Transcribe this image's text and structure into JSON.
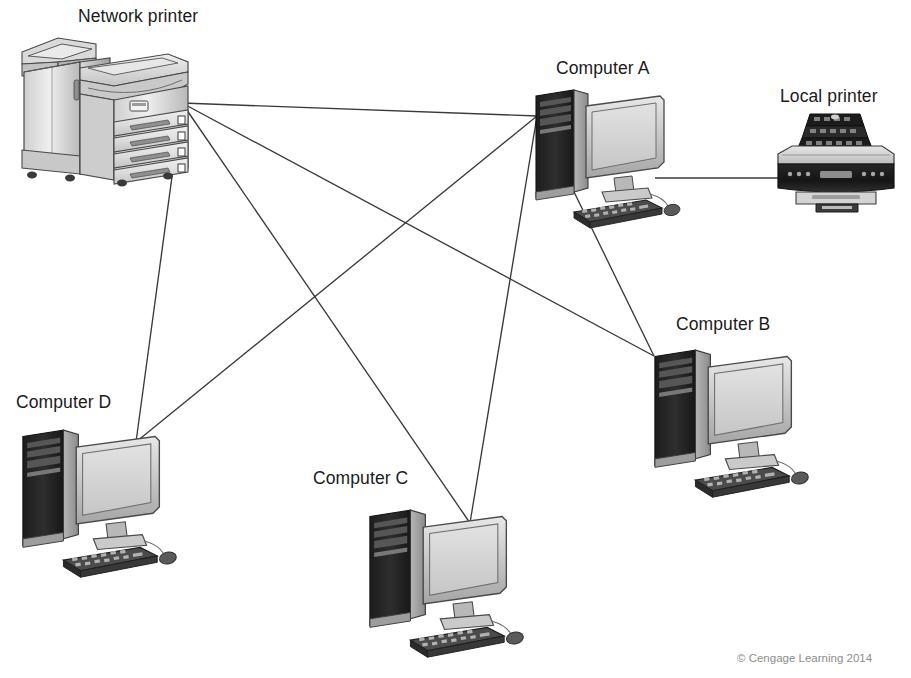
{
  "diagram": {
    "background_color": "#ffffff",
    "line_color": "#3a3a3a",
    "label_color": "#1b1b1b",
    "copyright": "© Cengage Learning 2014",
    "nodes": [
      {
        "id": "network-printer",
        "label": "Network printer",
        "type": "network-printer",
        "label_x": 78,
        "label_y": 6,
        "x": 18,
        "y": 28,
        "w": 175,
        "h": 160,
        "port_x": 182,
        "port_y": 103
      },
      {
        "id": "computer-a",
        "label": "Computer A",
        "type": "desktop-computer",
        "label_x": 556,
        "label_y": 58,
        "x": 528,
        "y": 88,
        "w": 150,
        "h": 150,
        "port_x": 537,
        "port_y": 116,
        "monitor_port_x": 655,
        "monitor_port_y": 178
      },
      {
        "id": "local-printer",
        "label": "Local printer",
        "type": "inkjet-printer",
        "label_x": 780,
        "label_y": 86,
        "x": 772,
        "y": 108,
        "w": 125,
        "h": 105,
        "port_x": 781,
        "port_y": 178
      },
      {
        "id": "computer-b",
        "label": "Computer B",
        "type": "desktop-computer",
        "label_x": 676,
        "label_y": 314,
        "x": 640,
        "y": 348,
        "w": 175,
        "h": 160,
        "port_x": 654,
        "port_y": 356
      },
      {
        "id": "computer-c",
        "label": "Computer C",
        "type": "desktop-computer",
        "label_x": 313,
        "label_y": 468,
        "x": 355,
        "y": 508,
        "w": 175,
        "h": 160,
        "port_x": 470,
        "port_y": 523
      },
      {
        "id": "computer-d",
        "label": "Computer D",
        "type": "desktop-computer",
        "label_x": 16,
        "label_y": 392,
        "x": 8,
        "y": 428,
        "w": 175,
        "h": 160,
        "port_x": 136,
        "port_y": 442
      }
    ],
    "links": [
      {
        "from": "network-printer",
        "to": "computer-a",
        "x1": 182,
        "y1": 103,
        "x2": 537,
        "y2": 116
      },
      {
        "from": "network-printer",
        "to": "computer-b",
        "x1": 182,
        "y1": 103,
        "x2": 654,
        "y2": 356
      },
      {
        "from": "network-printer",
        "to": "computer-c",
        "x1": 182,
        "y1": 103,
        "x2": 470,
        "y2": 523
      },
      {
        "from": "network-printer",
        "to": "computer-d",
        "x1": 182,
        "y1": 103,
        "x2": 136,
        "y2": 442
      },
      {
        "from": "computer-a",
        "to": "computer-b",
        "x1": 537,
        "y1": 116,
        "x2": 654,
        "y2": 356
      },
      {
        "from": "computer-a",
        "to": "computer-c",
        "x1": 537,
        "y1": 116,
        "x2": 470,
        "y2": 523
      },
      {
        "from": "computer-a",
        "to": "computer-d",
        "x1": 537,
        "y1": 116,
        "x2": 136,
        "y2": 442
      },
      {
        "from": "computer-a",
        "to": "local-printer",
        "x1": 655,
        "y1": 178,
        "x2": 781,
        "y2": 178
      }
    ]
  }
}
